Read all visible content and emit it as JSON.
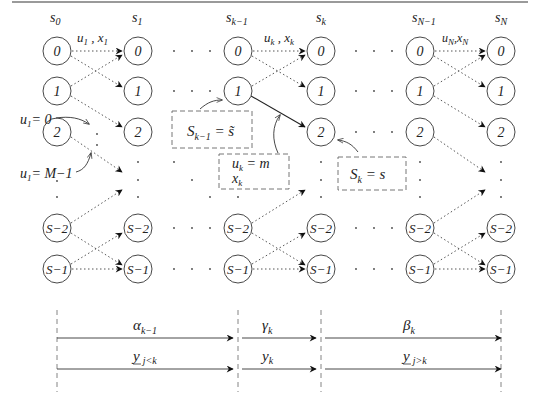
{
  "diagram": {
    "type": "trellis",
    "columns": [
      {
        "id": "s0",
        "label": "s",
        "sub": "0",
        "x": 57
      },
      {
        "id": "s1",
        "label": "s",
        "sub": "1",
        "x": 138
      },
      {
        "id": "sk1",
        "label": "s",
        "sub": "k−1",
        "x": 238
      },
      {
        "id": "sk",
        "label": "s",
        "sub": "k",
        "x": 321
      },
      {
        "id": "sN1",
        "label": "s",
        "sub": "N−1",
        "x": 420
      },
      {
        "id": "sN",
        "label": "s",
        "sub": "N",
        "x": 501
      }
    ],
    "rows": [
      {
        "id": "r0",
        "label": "0",
        "y": 51
      },
      {
        "id": "r1",
        "label": "1",
        "y": 91
      },
      {
        "id": "r2",
        "label": "2",
        "y": 132
      },
      {
        "id": "rS2",
        "label": "S−2",
        "y": 228
      },
      {
        "id": "rS1",
        "label": "S−1",
        "y": 269
      }
    ],
    "transition_labels": [
      {
        "id": "u1x1",
        "main1": "u",
        "sub1": "1",
        "sep": " , ",
        "main2": "x",
        "sub2": "1",
        "x": 77,
        "y": 37
      },
      {
        "id": "ukxk",
        "main1": "u",
        "sub1": "k",
        "sep": " , ",
        "main2": "x",
        "sub2": "k",
        "x": 258,
        "y": 37
      },
      {
        "id": "uNxN",
        "main1": "u",
        "sub1": "N",
        "sep": ",",
        "main2": "x",
        "sub2": "N",
        "x": 442,
        "y": 37
      }
    ],
    "annotations": {
      "u1_zero": {
        "main": "u",
        "sub": "1",
        "rest": "= 0"
      },
      "u1_max": {
        "main": "u",
        "sub": "1",
        "rest": "= M−1"
      },
      "box_prev_state": {
        "main": "S",
        "sub": "k−1",
        "rest": " = s̃"
      },
      "box_input": {
        "line1_main": "u",
        "line1_sub": "k",
        "line1_rest": " = m",
        "line2_main": "x",
        "line2_sub": "k"
      },
      "box_state": {
        "main": "S",
        "sub": "k",
        "rest": " = s"
      }
    },
    "bottom_segments": {
      "row1": [
        {
          "main": "α",
          "sub": "k−1",
          "underline": false
        },
        {
          "main": "γ",
          "sub": "k",
          "underline": false
        },
        {
          "main": "β",
          "sub": "k",
          "underline": false
        }
      ],
      "row2": [
        {
          "main": "y",
          "sub": "j<k",
          "underline": true
        },
        {
          "main": "y",
          "sub": "k",
          "underline": false
        },
        {
          "main": "y",
          "sub": "j>k",
          "underline": true
        }
      ]
    },
    "colors": {
      "line": "#222222",
      "dotted": "#555555",
      "dashed": "#666666",
      "rule": "#9a9a9a"
    }
  }
}
